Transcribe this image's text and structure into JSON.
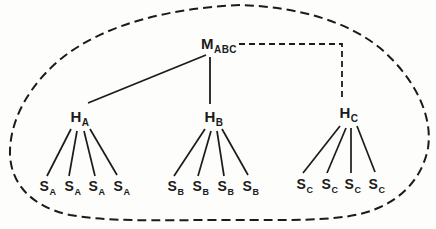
{
  "colors": {
    "ink": "#1b1b1b",
    "paper": "#fdfdfc"
  },
  "nodes": {
    "root": {
      "main": "M",
      "sub": "ABC"
    },
    "hubs": [
      {
        "main": "H",
        "sub": "A"
      },
      {
        "main": "H",
        "sub": "B"
      },
      {
        "main": "H",
        "sub": "C"
      }
    ],
    "leaves_a": [
      {
        "main": "S",
        "sub": "A"
      },
      {
        "main": "S",
        "sub": "A"
      },
      {
        "main": "S",
        "sub": "A"
      },
      {
        "main": "S",
        "sub": "A"
      }
    ],
    "leaves_b": [
      {
        "main": "S",
        "sub": "B"
      },
      {
        "main": "S",
        "sub": "B"
      },
      {
        "main": "S",
        "sub": "B"
      },
      {
        "main": "S",
        "sub": "B"
      }
    ],
    "leaves_c": [
      {
        "main": "S",
        "sub": "C"
      },
      {
        "main": "S",
        "sub": "C"
      },
      {
        "main": "S",
        "sub": "C"
      },
      {
        "main": "S",
        "sub": "C"
      }
    ]
  }
}
